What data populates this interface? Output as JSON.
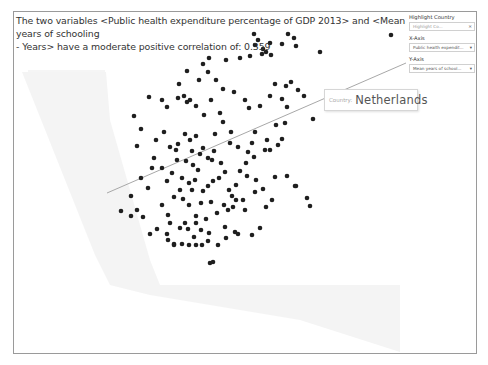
{
  "caption": {
    "line1": "The two variables <Public health expenditure percentage of GDP 2013> and <Mean years of schooling",
    "line2": "- Years> have a moderate positive correlation of: 0.359"
  },
  "controls": {
    "highlight_label": "Highlight Country",
    "highlight_placeholder": "Highlight Co...",
    "x_axis_label": "X-Axis",
    "x_axis_value": "Public health expendit...",
    "y_axis_label": "Y-Axis",
    "y_axis_value": "Mean years of school...",
    "dropdown_icon": "▾",
    "clear_icon": "×"
  },
  "tooltip": {
    "key": "Country:",
    "value": "Netherlands"
  },
  "colors": {
    "dot": "#1f1f1f",
    "trend": "#a8a8a8",
    "frame": "#9a9a9a",
    "background_band": "#f1f1f1"
  },
  "chart_data": {
    "type": "scatter",
    "title": "The two variables <Public health expenditure percentage of GDP 2013> and <Mean years of schooling - Years> have a moderate positive correlation of: 0.359",
    "xlabel": "Public health expenditure percentage of GDP 2013",
    "ylabel": "Mean years of schooling - Years",
    "correlation": 0.359,
    "grid": false,
    "axes_shown": false,
    "highlighted": "Netherlands",
    "trend_line_px": [
      [
        107,
        193
      ],
      [
        406,
        63
      ]
    ],
    "points_px": [
      [
        391,
        35
      ],
      [
        320,
        52
      ],
      [
        288,
        34
      ],
      [
        294,
        38
      ],
      [
        296,
        46
      ],
      [
        282,
        44
      ],
      [
        270,
        43
      ],
      [
        254,
        34
      ],
      [
        258,
        40
      ],
      [
        255,
        45
      ],
      [
        263,
        49
      ],
      [
        266,
        52
      ],
      [
        271,
        55
      ],
      [
        262,
        54
      ],
      [
        250,
        56
      ],
      [
        240,
        58
      ],
      [
        226,
        60
      ],
      [
        209,
        58
      ],
      [
        203,
        64
      ],
      [
        208,
        72
      ],
      [
        216,
        80
      ],
      [
        199,
        80
      ],
      [
        187,
        71
      ],
      [
        179,
        84
      ],
      [
        184,
        96
      ],
      [
        190,
        100
      ],
      [
        211,
        100
      ],
      [
        223,
        89
      ],
      [
        234,
        92
      ],
      [
        245,
        100
      ],
      [
        249,
        108
      ],
      [
        260,
        106
      ],
      [
        270,
        96
      ],
      [
        275,
        84
      ],
      [
        286,
        86
      ],
      [
        291,
        82
      ],
      [
        298,
        90
      ],
      [
        282,
        99
      ],
      [
        287,
        107
      ],
      [
        304,
        96
      ],
      [
        313,
        119
      ],
      [
        285,
        123
      ],
      [
        276,
        125
      ],
      [
        267,
        140
      ],
      [
        265,
        150
      ],
      [
        252,
        143
      ],
      [
        255,
        132
      ],
      [
        231,
        132
      ],
      [
        223,
        122
      ],
      [
        220,
        113
      ],
      [
        204,
        115
      ],
      [
        196,
        106
      ],
      [
        187,
        102
      ],
      [
        178,
        98
      ],
      [
        167,
        107
      ],
      [
        162,
        100
      ],
      [
        149,
        97
      ],
      [
        134,
        116
      ],
      [
        141,
        129
      ],
      [
        137,
        146
      ],
      [
        156,
        140
      ],
      [
        164,
        132
      ],
      [
        170,
        147
      ],
      [
        176,
        150
      ],
      [
        178,
        144
      ],
      [
        185,
        134
      ],
      [
        190,
        140
      ],
      [
        196,
        136
      ],
      [
        203,
        148
      ],
      [
        214,
        151
      ],
      [
        212,
        160
      ],
      [
        221,
        163
      ],
      [
        219,
        178
      ],
      [
        213,
        181
      ],
      [
        203,
        191
      ],
      [
        195,
        180
      ],
      [
        180,
        190
      ],
      [
        177,
        160
      ],
      [
        186,
        161
      ],
      [
        193,
        165
      ],
      [
        198,
        170
      ],
      [
        208,
        158
      ],
      [
        215,
        134
      ],
      [
        230,
        143
      ],
      [
        238,
        147
      ],
      [
        248,
        152
      ],
      [
        254,
        157
      ],
      [
        246,
        163
      ],
      [
        240,
        171
      ],
      [
        236,
        185
      ],
      [
        229,
        190
      ],
      [
        232,
        196
      ],
      [
        243,
        200
      ],
      [
        245,
        210
      ],
      [
        224,
        205
      ],
      [
        217,
        213
      ],
      [
        206,
        219
      ],
      [
        196,
        216
      ],
      [
        189,
        205
      ],
      [
        183,
        199
      ],
      [
        174,
        197
      ],
      [
        162,
        205
      ],
      [
        168,
        215
      ],
      [
        170,
        223
      ],
      [
        157,
        229
      ],
      [
        150,
        234
      ],
      [
        143,
        217
      ],
      [
        137,
        210
      ],
      [
        131,
        196
      ],
      [
        121,
        211
      ],
      [
        131,
        216
      ],
      [
        148,
        188
      ],
      [
        141,
        178
      ],
      [
        152,
        168
      ],
      [
        154,
        158
      ],
      [
        162,
        168
      ],
      [
        167,
        181
      ],
      [
        172,
        173
      ],
      [
        182,
        178
      ],
      [
        192,
        190
      ],
      [
        201,
        203
      ],
      [
        211,
        202
      ],
      [
        225,
        227
      ],
      [
        235,
        232
      ],
      [
        252,
        235
      ],
      [
        260,
        228
      ],
      [
        266,
        207
      ],
      [
        272,
        200
      ],
      [
        263,
        189
      ],
      [
        256,
        180
      ],
      [
        275,
        177
      ],
      [
        287,
        176
      ],
      [
        296,
        186
      ],
      [
        307,
        198
      ],
      [
        310,
        206
      ],
      [
        295,
        186
      ],
      [
        226,
        238
      ],
      [
        238,
        234
      ],
      [
        218,
        245
      ],
      [
        208,
        241
      ],
      [
        202,
        245
      ],
      [
        196,
        245
      ],
      [
        189,
        245
      ],
      [
        182,
        244
      ],
      [
        174,
        244
      ],
      [
        167,
        234
      ],
      [
        185,
        223
      ],
      [
        194,
        237
      ],
      [
        201,
        230
      ],
      [
        209,
        233
      ],
      [
        210,
        263
      ],
      [
        213,
        262
      ],
      [
        196,
        223
      ],
      [
        188,
        229
      ],
      [
        180,
        228
      ],
      [
        174,
        245
      ],
      [
        168,
        240
      ],
      [
        228,
        210
      ],
      [
        233,
        207
      ],
      [
        236,
        200
      ],
      [
        270,
        150
      ],
      [
        278,
        145
      ],
      [
        282,
        139
      ],
      [
        247,
        176
      ],
      [
        255,
        192
      ],
      [
        225,
        172
      ],
      [
        208,
        186
      ],
      [
        189,
        183
      ],
      [
        192,
        151
      ],
      [
        200,
        154
      ]
    ]
  }
}
